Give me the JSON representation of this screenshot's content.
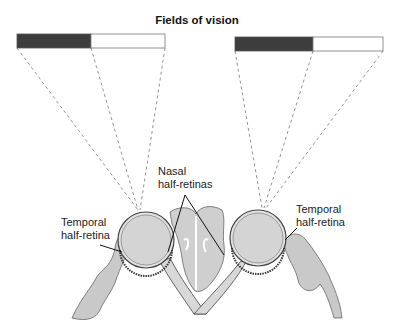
{
  "title": "Fields of vision",
  "labels": {
    "nasal": {
      "line1": "Nasal",
      "line2": "half-retinas"
    },
    "temporal_left": {
      "line1": "Temporal",
      "line2": "half-retina"
    },
    "temporal_right": {
      "line1": "Temporal",
      "line2": "half-retina"
    }
  },
  "visual_fields": [
    {
      "side": "left",
      "dark_portion": "temporal",
      "colors": {
        "dark": "#3d3d3d",
        "light": "#ffffff"
      }
    },
    {
      "side": "right",
      "dark_portion": "nasal",
      "colors": {
        "dark": "#3d3d3d",
        "light": "#ffffff"
      }
    }
  ],
  "colors": {
    "tissue": "#c9c9c9",
    "tissue_dark": "#9a9a9a",
    "outline": "#555555",
    "dash": "#777777"
  }
}
